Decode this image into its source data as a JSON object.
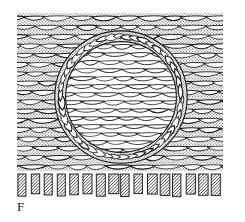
{
  "figure": {
    "panel_label": "F",
    "background_color": "#ffffff",
    "ink_color": "#1a1a1a",
    "stipple_color": "#8c8c8c",
    "interior_fill": "#ffffff",
    "capsule_fill": "#ffffff"
  },
  "regions": {
    "matrix": {
      "name": "stippled-layered-matrix",
      "x": 17,
      "y": 13,
      "width": 206,
      "height": 158,
      "fill": "stipple",
      "row_count": 17,
      "row_height": 9.3,
      "cell_style": "horizontal lenticular (lens/leaf) cells"
    },
    "nodule": {
      "name": "circular-nodule",
      "center_x": 121,
      "center_y": 97,
      "outer_radius": 66,
      "inner_radius": 55,
      "interior_fill": "#ffffff",
      "interior_row_count": 14,
      "interior_row_height": 8.0
    },
    "capsule": {
      "name": "fibrous-capsule-ring",
      "cell_count": 46,
      "ring_thickness": 11,
      "orientation": "tangential"
    },
    "basal_layer": {
      "name": "hatched-basal-layer",
      "x": 17,
      "y": 173,
      "width": 206,
      "height": 25,
      "picket_count": 16,
      "picket_width": 9,
      "hatch_direction": "bottom-left to top-right",
      "hatch_spacing": 3.2
    }
  },
  "chart_data": {
    "type": "diagram",
    "title": "F",
    "elements": [
      {
        "label": "stippled layered matrix",
        "rows": 17
      },
      {
        "label": "fibrous capsule ring",
        "cells": 46
      },
      {
        "label": "nodule interior",
        "rows": 14
      },
      {
        "label": "hatched basal pickets",
        "count": 16
      }
    ]
  }
}
